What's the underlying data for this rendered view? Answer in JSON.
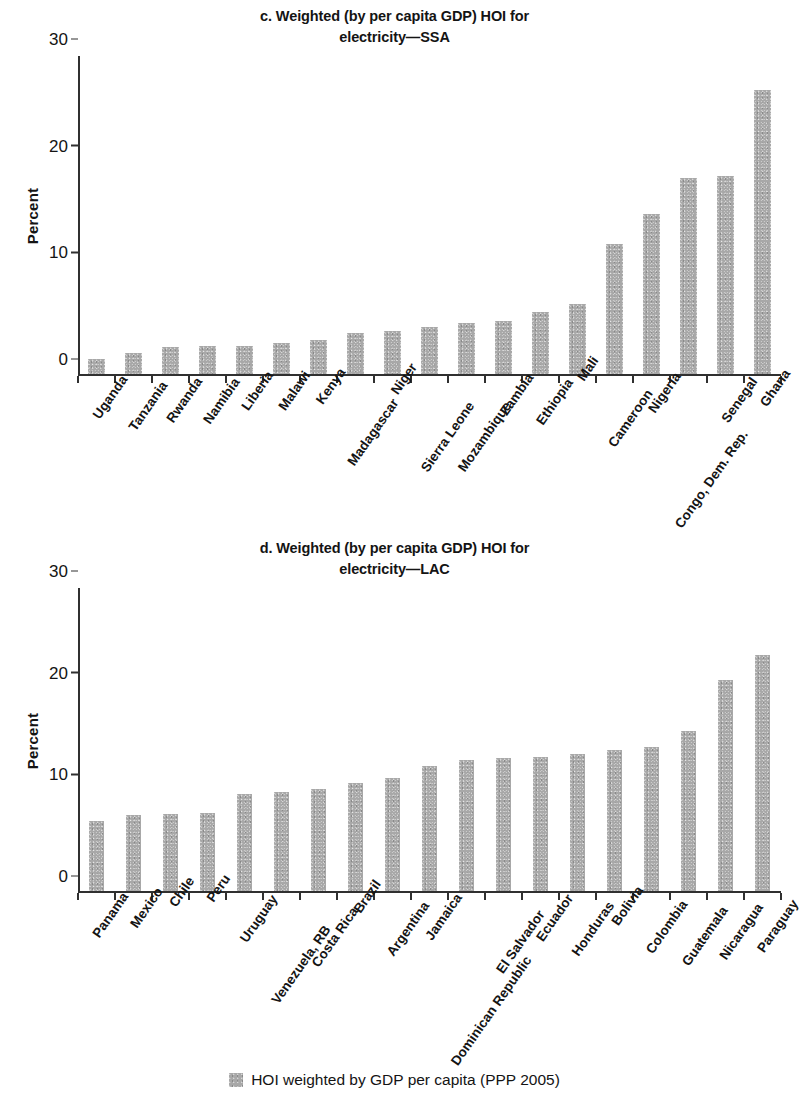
{
  "legend": {
    "swatch_color": "#a8a8a8",
    "label": "HOI weighted by GDP per capita (PPP 2005)"
  },
  "panels": [
    {
      "id": "c",
      "title": "c. Weighted (by per capita GDP) HOI for electricity—SSA",
      "title_line1": "c. Weighted (by per capita GDP) HOI for",
      "title_line2": "electricity—SSA",
      "ylabel": "Percent"
    },
    {
      "id": "d",
      "title": "d. Weighted (by per capita GDP) HOI for electricity—LAC",
      "title_line1": "d. Weighted (by per capita GDP) HOI for",
      "title_line2": "electricity—LAC",
      "ylabel": "Percent"
    }
  ],
  "chart_data": [
    {
      "type": "bar",
      "panel": "c",
      "title": "c. Weighted (by per capita GDP) HOI for electricity—SSA",
      "xlabel": "",
      "ylabel": "Percent",
      "ylim": [
        0,
        30
      ],
      "yticks": [
        0,
        10,
        20,
        30
      ],
      "grid": false,
      "legend_position": "bottom",
      "bar_color": "#a8a8a8",
      "series_name": "HOI weighted by GDP per capita (PPP 2005)",
      "categories": [
        "Uganda",
        "Tanzania",
        "Rwanda",
        "Namibia",
        "Liberia",
        "Malawi",
        "Kenya",
        "Madagascar",
        "Niger",
        "Sierra Leone",
        "Mozambique",
        "Zambia",
        "Ethiopia",
        "Mali",
        "Cameroon",
        "Nigeria",
        "Congo, Dem. Rep.",
        "Senegal",
        "Ghana"
      ],
      "values": [
        1.6,
        2.2,
        2.7,
        2.8,
        2.8,
        3.1,
        3.4,
        4.0,
        4.2,
        4.6,
        5.0,
        5.2,
        6.0,
        6.8,
        12.4,
        15.2,
        18.6,
        18.8,
        26.8
      ]
    },
    {
      "type": "bar",
      "panel": "d",
      "title": "d. Weighted (by per capita GDP) HOI for electricity—LAC",
      "xlabel": "",
      "ylabel": "Percent",
      "ylim": [
        0,
        30
      ],
      "yticks": [
        0,
        10,
        20,
        30
      ],
      "grid": false,
      "legend_position": "bottom",
      "bar_color": "#a8a8a8",
      "series_name": "HOI weighted by GDP per capita (PPP 2005)",
      "categories": [
        "Panama",
        "Mexico",
        "Chile",
        "Peru",
        "Uruguay",
        "Venezuela, RB",
        "Costa Rica",
        "Brazil",
        "Argentina",
        "Jamaica",
        "Dominican Republic",
        "El Salvador",
        "Ecuador",
        "Honduras",
        "Bolivia",
        "Colombia",
        "Guatemala",
        "Nicaragua",
        "Paraguay"
      ],
      "values": [
        7.1,
        7.7,
        7.8,
        7.9,
        9.7,
        9.9,
        10.2,
        10.8,
        11.3,
        12.5,
        13.1,
        13.3,
        13.4,
        13.7,
        14.1,
        14.4,
        15.9,
        21.0,
        23.4
      ]
    }
  ]
}
